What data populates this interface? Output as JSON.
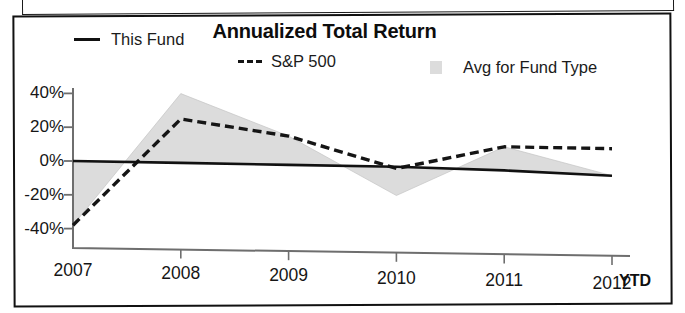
{
  "chart_data": {
    "type": "line",
    "title": "Annualized Total Return",
    "xlabel": "",
    "ylabel": "",
    "x": [
      "2007",
      "2008",
      "2009",
      "2010",
      "2011",
      "2012"
    ],
    "x_axis_suffix": "YTD",
    "xtick_labels": [
      "2007",
      "2008",
      "2009",
      "2010",
      "2011",
      "2012"
    ],
    "ytick_labels": [
      "40%",
      "20%",
      "0%",
      "-20%",
      "-40%"
    ],
    "ytick_values": [
      40,
      20,
      0,
      -20,
      -40
    ],
    "ylim": [
      -50,
      48
    ],
    "grid": false,
    "legend_position": "top",
    "series": [
      {
        "name": "This Fund",
        "style": "solid",
        "color": "#111111",
        "values": [
          0,
          -1,
          -2,
          -3,
          -5,
          -8
        ]
      },
      {
        "name": "S&P 500",
        "style": "dashed",
        "color": "#151515",
        "values": [
          -38,
          25,
          15,
          -4,
          9,
          8
        ]
      },
      {
        "name": "Avg for Fund Type",
        "style": "area",
        "color": "#dcdcdc",
        "values": [
          -38,
          40,
          15,
          -20,
          9,
          -8
        ]
      }
    ],
    "legend": [
      {
        "label": "This Fund",
        "marker": "solid-line-swatch"
      },
      {
        "label": "S&P 500",
        "marker": "dashed-line-swatch"
      },
      {
        "label": "Avg for Fund Type",
        "marker": "area-square-swatch"
      }
    ],
    "colors": {
      "line": "#111111",
      "dashed": "#151515",
      "area_fill": "#dcdcdc",
      "axis": "#6e6e6e",
      "text": "#161616"
    }
  }
}
